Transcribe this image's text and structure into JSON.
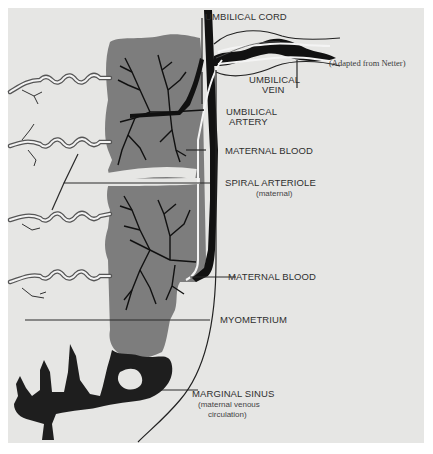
{
  "figure": {
    "credit": "(Adapted from Netter)",
    "caption": "Figure 4-2 — Placental circulation",
    "labels": {
      "umbilical_cord": "UMBILICAL CORD",
      "umbilical_vein_1": "UMBILICAL",
      "umbilical_vein_2": "VEIN",
      "umbilical_artery_1": "UMBILICAL",
      "umbilical_artery_2": "ARTERY",
      "maternal_blood_top": "MATERNAL BLOOD",
      "spiral_arteriole": "SPIRAL ARTERIOLE",
      "spiral_arteriole_sub": "(maternal)",
      "maternal_blood_bottom": "MATERNAL BLOOD",
      "myometrium": "MYOMETRIUM",
      "marginal_sinus": "MARGINAL SINUS",
      "marginal_sinus_sub_1": "(maternal venous",
      "marginal_sinus_sub_2": "circulation)"
    },
    "colors": {
      "panel": "#e6e6e4",
      "maternal_blood": "#7d7d7d",
      "vessel": "#111111",
      "line": "#2a2a2a"
    }
  }
}
